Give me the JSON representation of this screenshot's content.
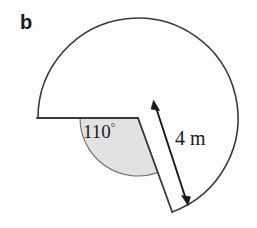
{
  "figure": {
    "part_label": "b",
    "angle_label": "110",
    "degree_symbol": "°",
    "length_label": "4 m",
    "shape": "circle-with-sector-removed",
    "colors": {
      "background": "#fdfdfd",
      "stroke": "#3a3a3a",
      "sector_fill": "#e2e2e2",
      "text": "#1a1a1a"
    },
    "geometry": {
      "center_x": 138,
      "center_y": 118,
      "radius_px": 100,
      "radius_value": 4,
      "radius_units": "m",
      "angle_degrees": 110,
      "arm1_angle_deg": 180,
      "arm2_angle_deg": 70,
      "arm1_end_x": 36,
      "arm1_end_y": 118,
      "arm2_end_x": 172,
      "arm2_end_y": 212,
      "angle_arc_radius_px": 58,
      "dimension_arrow_start_x": 155,
      "dimension_arrow_start_y": 103,
      "dimension_arrow_end_x": 188,
      "dimension_arrow_end_y": 204
    }
  }
}
